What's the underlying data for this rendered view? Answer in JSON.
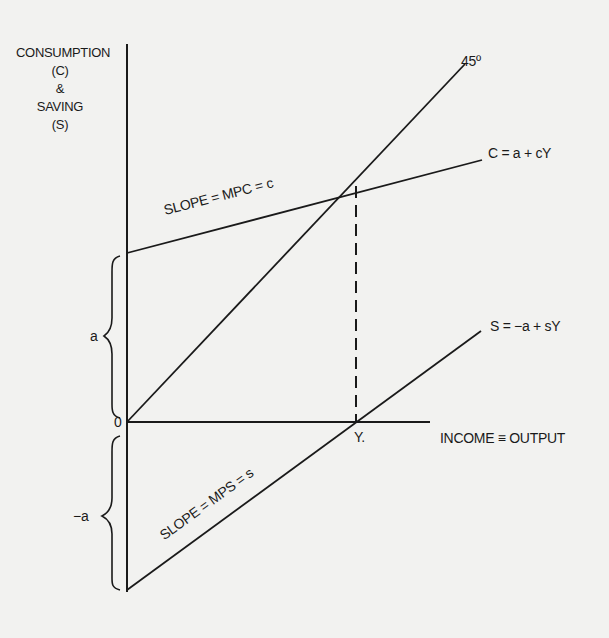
{
  "diagram": {
    "type": "keynesian-consumption-saving",
    "y_axis_label": [
      "CONSUMPTION",
      "(C)",
      "&",
      "SAVING",
      "(S)"
    ],
    "x_axis_label": "INCOME ≡ OUTPUT",
    "origin_label": "0",
    "line_45_label": "45º",
    "consumption_function_label": "C = a + cY",
    "saving_function_label": "S = −a + sY",
    "consumption_slope_label": "SLOPE = MPC = c",
    "saving_slope_label": "SLOPE = MPS = s",
    "break_even_income_label": "Y.",
    "intercept_positive_label": "a",
    "intercept_negative_label": "−a"
  },
  "colors": {
    "background": "#f2f2f0",
    "ink": "#1a1a1a"
  }
}
